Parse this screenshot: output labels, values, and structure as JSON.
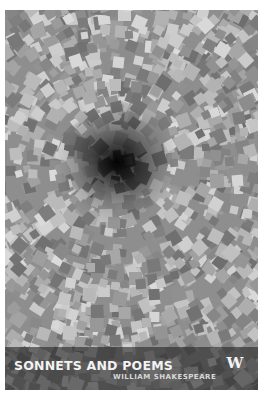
{
  "book": {
    "title": "SONNETS AND POEMS",
    "author": "WILLIAM SHAKESPEARE",
    "publisher_logo": "W"
  },
  "cover": {
    "style": "grayscale mosaic of rotated squares with dark radial vortex",
    "band_color": "#2a2a2a",
    "text_color": "#f2f2f2"
  }
}
